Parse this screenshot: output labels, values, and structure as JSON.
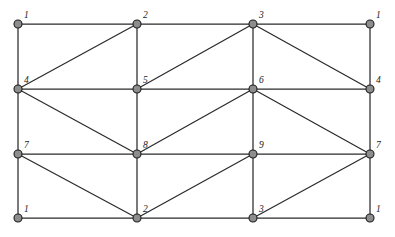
{
  "figure": {
    "type": "node-link-graph",
    "title": "",
    "background_color": "#ffffff",
    "width": 395,
    "height": 237
  },
  "style": {
    "edge_color": "#2b2b2b",
    "edge_width": 1.25,
    "node_fill": "#8d8d8d",
    "node_stroke": "#1e1e1e",
    "node_radius": 4,
    "label_color": "#1a1a1a",
    "label_font_size": 9.5
  },
  "layout": {
    "columns_x": [
      18,
      137,
      253,
      370
    ],
    "rows_y": [
      24,
      89,
      154,
      218
    ]
  },
  "nodes": [
    {
      "id": "n00",
      "label": "1",
      "x": 18,
      "y": 24,
      "label_dx": 6,
      "label_dy": -13
    },
    {
      "id": "n01",
      "label": "2",
      "x": 137,
      "y": 24,
      "label_dx": 6,
      "label_dy": -13
    },
    {
      "id": "n02",
      "label": "3",
      "x": 253,
      "y": 24,
      "label_dx": 6,
      "label_dy": -13
    },
    {
      "id": "n03",
      "label": "1",
      "x": 370,
      "y": 24,
      "label_dx": 6,
      "label_dy": -13
    },
    {
      "id": "n10",
      "label": "4",
      "x": 18,
      "y": 89,
      "label_dx": 6,
      "label_dy": -13
    },
    {
      "id": "n11",
      "label": "5",
      "x": 137,
      "y": 89,
      "label_dx": 6,
      "label_dy": -13
    },
    {
      "id": "n12",
      "label": "6",
      "x": 253,
      "y": 89,
      "label_dx": 6,
      "label_dy": -13
    },
    {
      "id": "n13",
      "label": "4",
      "x": 370,
      "y": 89,
      "label_dx": 6,
      "label_dy": -13
    },
    {
      "id": "n20",
      "label": "7",
      "x": 18,
      "y": 154,
      "label_dx": 6,
      "label_dy": -13
    },
    {
      "id": "n21",
      "label": "8",
      "x": 137,
      "y": 154,
      "label_dx": 6,
      "label_dy": -13
    },
    {
      "id": "n22",
      "label": "9",
      "x": 253,
      "y": 154,
      "label_dx": 6,
      "label_dy": -13
    },
    {
      "id": "n23",
      "label": "7",
      "x": 370,
      "y": 154,
      "label_dx": 6,
      "label_dy": -13
    },
    {
      "id": "n30",
      "label": "1",
      "x": 18,
      "y": 218,
      "label_dx": 6,
      "label_dy": -13
    },
    {
      "id": "n31",
      "label": "2",
      "x": 137,
      "y": 218,
      "label_dx": 6,
      "label_dy": -13
    },
    {
      "id": "n32",
      "label": "3",
      "x": 253,
      "y": 218,
      "label_dx": 6,
      "label_dy": -13
    },
    {
      "id": "n33",
      "label": "1",
      "x": 370,
      "y": 218,
      "label_dx": 6,
      "label_dy": -13
    }
  ],
  "edges": [
    {
      "from": "n00",
      "to": "n01",
      "kind": "horizontal"
    },
    {
      "from": "n01",
      "to": "n02",
      "kind": "horizontal"
    },
    {
      "from": "n02",
      "to": "n03",
      "kind": "horizontal"
    },
    {
      "from": "n10",
      "to": "n11",
      "kind": "horizontal"
    },
    {
      "from": "n11",
      "to": "n12",
      "kind": "horizontal"
    },
    {
      "from": "n12",
      "to": "n13",
      "kind": "horizontal"
    },
    {
      "from": "n20",
      "to": "n21",
      "kind": "horizontal"
    },
    {
      "from": "n21",
      "to": "n22",
      "kind": "horizontal"
    },
    {
      "from": "n22",
      "to": "n23",
      "kind": "horizontal"
    },
    {
      "from": "n30",
      "to": "n31",
      "kind": "horizontal"
    },
    {
      "from": "n31",
      "to": "n32",
      "kind": "horizontal"
    },
    {
      "from": "n32",
      "to": "n33",
      "kind": "horizontal"
    },
    {
      "from": "n00",
      "to": "n10",
      "kind": "vertical"
    },
    {
      "from": "n10",
      "to": "n20",
      "kind": "vertical"
    },
    {
      "from": "n20",
      "to": "n30",
      "kind": "vertical"
    },
    {
      "from": "n01",
      "to": "n11",
      "kind": "vertical"
    },
    {
      "from": "n11",
      "to": "n21",
      "kind": "vertical"
    },
    {
      "from": "n21",
      "to": "n31",
      "kind": "vertical"
    },
    {
      "from": "n02",
      "to": "n12",
      "kind": "vertical"
    },
    {
      "from": "n12",
      "to": "n22",
      "kind": "vertical"
    },
    {
      "from": "n22",
      "to": "n32",
      "kind": "vertical"
    },
    {
      "from": "n03",
      "to": "n13",
      "kind": "vertical"
    },
    {
      "from": "n13",
      "to": "n23",
      "kind": "vertical"
    },
    {
      "from": "n23",
      "to": "n33",
      "kind": "vertical"
    },
    {
      "from": "n10",
      "to": "n01",
      "kind": "diagonal"
    },
    {
      "from": "n11",
      "to": "n02",
      "kind": "diagonal"
    },
    {
      "from": "n02",
      "to": "n13",
      "kind": "diagonal"
    },
    {
      "from": "n10",
      "to": "n21",
      "kind": "diagonal"
    },
    {
      "from": "n21",
      "to": "n12",
      "kind": "diagonal"
    },
    {
      "from": "n12",
      "to": "n23",
      "kind": "diagonal"
    },
    {
      "from": "n20",
      "to": "n31",
      "kind": "diagonal"
    },
    {
      "from": "n31",
      "to": "n22",
      "kind": "diagonal"
    },
    {
      "from": "n32",
      "to": "n23",
      "kind": "diagonal"
    }
  ]
}
